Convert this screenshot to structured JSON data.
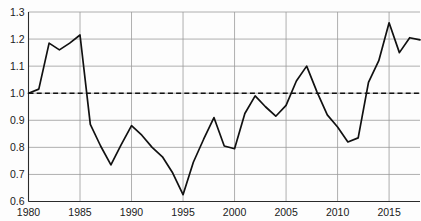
{
  "chart_data": {
    "type": "line",
    "title": "",
    "xlabel": "",
    "ylabel": "",
    "xlim": [
      1980,
      2018
    ],
    "ylim": [
      0.6,
      1.3
    ],
    "grid": true,
    "legend": "none",
    "x_ticks": [
      "1980",
      "1985",
      "1990",
      "1995",
      "2000",
      "2005",
      "2010",
      "2015"
    ],
    "x_tick_values": [
      1980,
      1985,
      1990,
      1995,
      2000,
      2005,
      2010,
      2015
    ],
    "y_ticks": [
      "0.6",
      "0.7",
      "0.8",
      "0.9",
      "1.0",
      "1.1",
      "1.2",
      "1.3"
    ],
    "y_tick_values": [
      0.6,
      0.7,
      0.8,
      0.9,
      1.0,
      1.1,
      1.2,
      1.3
    ],
    "reference_line": {
      "value": 1.0,
      "style": "dashed",
      "label": ""
    },
    "x": [
      1980,
      1981,
      1982,
      1983,
      1984,
      1985,
      1986,
      1987,
      1988,
      1989,
      1990,
      1991,
      1992,
      1993,
      1994,
      1995,
      1996,
      1997,
      1998,
      1999,
      2000,
      2001,
      2002,
      2003,
      2004,
      2005,
      2006,
      2007,
      2008,
      2009,
      2010,
      2011,
      2012,
      2013,
      2014,
      2015,
      2016,
      2017,
      2018
    ],
    "values": [
      1.0,
      1.015,
      1.185,
      1.16,
      1.185,
      1.215,
      0.885,
      0.805,
      0.735,
      0.81,
      0.88,
      0.845,
      0.8,
      0.765,
      0.705,
      0.625,
      0.745,
      0.83,
      0.91,
      0.805,
      0.795,
      0.925,
      0.99,
      0.95,
      0.915,
      0.955,
      1.045,
      1.1,
      1.005,
      0.92,
      0.875,
      0.82,
      0.835,
      1.04,
      1.12,
      1.26,
      1.15,
      1.205,
      1.197
    ],
    "series": [
      {
        "name": "index",
        "color": "#111111",
        "values": [
          1.0,
          1.015,
          1.185,
          1.16,
          1.185,
          1.215,
          0.885,
          0.805,
          0.735,
          0.81,
          0.88,
          0.845,
          0.8,
          0.765,
          0.705,
          0.625,
          0.745,
          0.83,
          0.91,
          0.805,
          0.795,
          0.925,
          0.99,
          0.95,
          0.915,
          0.955,
          1.045,
          1.1,
          1.005,
          0.92,
          0.875,
          0.82,
          0.835,
          1.04,
          1.12,
          1.26,
          1.15,
          1.205,
          1.197
        ]
      }
    ]
  },
  "colors": {
    "line": "#111111",
    "grid": "#9a9a9a",
    "axis": "#2b2b2b",
    "reference": "#111111",
    "background": "#fdfdfd"
  }
}
